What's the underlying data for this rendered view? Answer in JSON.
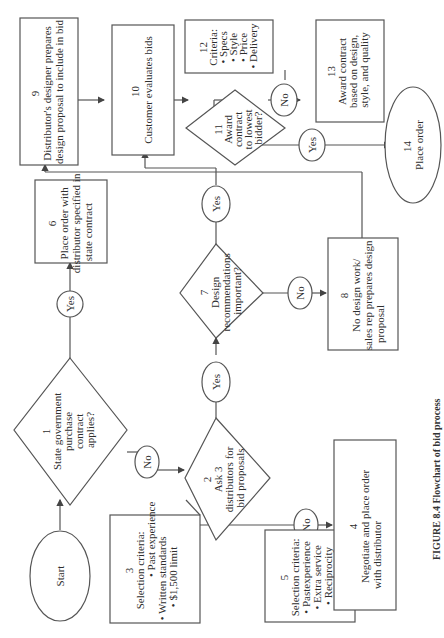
{
  "figure": {
    "orientation": "rotated-90-clockwise",
    "caption": "FIGURE 8.4  Flowchart of bid process"
  },
  "nodes": {
    "start": {
      "label": "Start"
    },
    "n1": {
      "num": "1",
      "lines": [
        "State government",
        "purchase",
        "contract",
        "applies?"
      ]
    },
    "n2": {
      "num": "2",
      "lines": [
        "Ask 3",
        "distributors for",
        "bid proposals"
      ]
    },
    "n3": {
      "num": "3",
      "lines": [
        "Selection criteria:",
        "• Past experience",
        "• Written standards",
        "• $1,500 limit"
      ]
    },
    "n4": {
      "num": "4",
      "lines": [
        "Negotiate and place order",
        "with distributor"
      ]
    },
    "n5": {
      "num": "5",
      "lines": [
        "Selection criteria:",
        "• Pastexperience",
        "• Extra service",
        "• Reciprocity"
      ]
    },
    "n6": {
      "num": "6",
      "lines": [
        "Place order with",
        "distributor specified in",
        "state contract"
      ]
    },
    "n7": {
      "num": "7",
      "lines": [
        "Design",
        "recommendations",
        "important?"
      ]
    },
    "n8": {
      "num": "8",
      "lines": [
        "No design work/",
        "sales rep prepares design",
        "proposal"
      ]
    },
    "n9": {
      "num": "9",
      "lines": [
        "Distributor's designer prepares",
        "design proposal to include in bid"
      ]
    },
    "n10": {
      "num": "10",
      "lines": [
        "Customer evaluates bids"
      ]
    },
    "n11": {
      "num": "11",
      "lines": [
        "Award",
        "contract",
        "to lowest",
        "bidder?"
      ]
    },
    "n12": {
      "num": "12",
      "lines": [
        "Criteria:",
        "• Specs",
        "• Style",
        "• Price",
        "• Delivery"
      ]
    },
    "n13": {
      "num": "13",
      "lines": [
        "Award contract",
        "based on design,",
        "style, and quality"
      ]
    },
    "n14": {
      "num": "14",
      "lines": [
        "Place order"
      ]
    }
  },
  "connectors": {
    "yes": "Yes",
    "no": "No"
  }
}
